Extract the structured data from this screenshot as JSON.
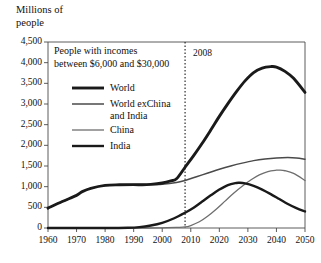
{
  "chart_data": {
    "type": "line",
    "title": "",
    "xlabel": "",
    "ylabel": "Millions of\npeople",
    "xlim": [
      1960,
      2050
    ],
    "ylim": [
      0,
      4500
    ],
    "grid": false,
    "legend_position": "upper-left-inside",
    "x_ticks": [
      "1960",
      "1970",
      "1980",
      "1990",
      "2000",
      "2010",
      "2020",
      "2030",
      "2040",
      "2050"
    ],
    "y_ticks": [
      "0",
      "500",
      "1,000",
      "1,500",
      "2,000",
      "2,500",
      "3,000",
      "3,500",
      "4,000",
      "4,500"
    ],
    "legend_title": "People with incomes\nbetween $6,000 and $30,000",
    "annotations": [
      {
        "name": "year-marker",
        "label": "2008",
        "x": 2008,
        "style": "dotted-vertical-line"
      }
    ],
    "series": [
      {
        "name": "World",
        "legend_label": "World",
        "stroke": "#1a1a1a",
        "width": 2.9,
        "x": [
          1960,
          1965,
          1970,
          1972,
          1975,
          1980,
          1985,
          1990,
          1993,
          1996,
          2000,
          2003,
          2005,
          2008,
          2011,
          2014,
          2017,
          2020,
          2023,
          2026,
          2029,
          2032,
          2035,
          2038,
          2040,
          2043,
          2046,
          2050
        ],
        "values": [
          480,
          640,
          790,
          880,
          960,
          1030,
          1045,
          1050,
          1045,
          1055,
          1090,
          1140,
          1190,
          1470,
          1750,
          2050,
          2370,
          2700,
          3010,
          3300,
          3560,
          3760,
          3870,
          3905,
          3895,
          3790,
          3620,
          3280
        ]
      },
      {
        "name": "World exChina and India",
        "legend_label": "World exChina\nand India",
        "stroke": "#4a4a4a",
        "width": 1.5,
        "x": [
          1960,
          1965,
          1970,
          1972,
          1975,
          1980,
          1985,
          1990,
          1995,
          2000,
          2005,
          2008,
          2012,
          2016,
          2020,
          2024,
          2028,
          2032,
          2036,
          2040,
          2044,
          2047,
          2050
        ],
        "values": [
          480,
          640,
          790,
          880,
          960,
          1030,
          1045,
          1050,
          1050,
          1060,
          1100,
          1150,
          1240,
          1330,
          1420,
          1500,
          1570,
          1630,
          1670,
          1695,
          1705,
          1695,
          1665
        ]
      },
      {
        "name": "China",
        "legend_label": "China",
        "stroke": "#6e6e6e",
        "width": 1.3,
        "x": [
          1960,
          1980,
          1995,
          2000,
          2005,
          2008,
          2010,
          2013,
          2016,
          2019,
          2022,
          2025,
          2028,
          2031,
          2034,
          2037,
          2040,
          2041,
          2043,
          2046,
          2050
        ],
        "values": [
          0,
          0,
          0,
          5,
          15,
          25,
          60,
          150,
          290,
          460,
          650,
          840,
          1010,
          1160,
          1285,
          1365,
          1398,
          1400,
          1385,
          1320,
          1150
        ]
      },
      {
        "name": "India",
        "legend_label": "India",
        "stroke": "#1a1a1a",
        "width": 2.4,
        "x": [
          1960,
          1980,
          1988,
          1992,
          1996,
          2000,
          2004,
          2008,
          2011,
          2014,
          2017,
          2020,
          2023,
          2026,
          2027,
          2029,
          2032,
          2035,
          2038,
          2041,
          2044,
          2047,
          2050
        ],
        "values": [
          0,
          0,
          5,
          20,
          60,
          125,
          230,
          370,
          490,
          640,
          790,
          930,
          1040,
          1090,
          1095,
          1080,
          1020,
          930,
          820,
          700,
          580,
          480,
          400
        ]
      }
    ]
  }
}
